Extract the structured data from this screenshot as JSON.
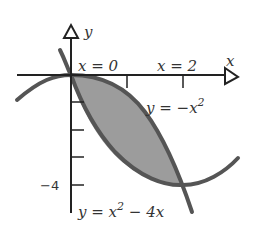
{
  "diagram": {
    "axes": {
      "x_label": "x",
      "y_label": "y",
      "y_tick_label": "−4"
    },
    "annotations": {
      "x0": "x = 0",
      "x2": "x = 2",
      "curve1": "y = −x",
      "curve1_exp": "2",
      "curve2_a": "y = x",
      "curve2_exp": "2",
      "curve2_b": " − 4x"
    },
    "curves": [
      {
        "name": "y = -x^2",
        "x_range": [
          -0.95,
          2.25
        ]
      },
      {
        "name": "y = x^2 - 4x",
        "x_range": [
          -0.17,
          2.15
        ]
      }
    ],
    "shaded_region": {
      "between": [
        "y = -x^2",
        "y = x^2 - 4x"
      ],
      "x_range": [
        0,
        2
      ]
    },
    "colors": {
      "curve": "#555555",
      "fill": "#9a9a9a",
      "axis": "#222222"
    }
  }
}
